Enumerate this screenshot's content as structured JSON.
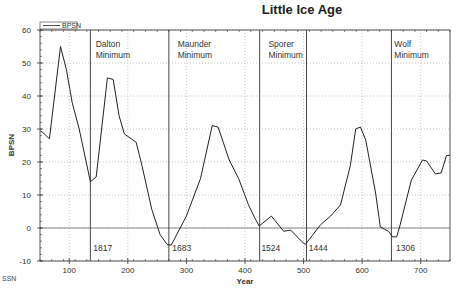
{
  "chart_data": {
    "type": "line",
    "title": "Little Ice Age",
    "xlabel": "Year",
    "ylabel": "BPSN",
    "xlim": [
      50,
      750
    ],
    "ylim": [
      -10,
      60
    ],
    "xticks": [
      100,
      200,
      300,
      400,
      500,
      600,
      700
    ],
    "yticks": [
      -10,
      0,
      10,
      20,
      30,
      40,
      50,
      60
    ],
    "grid": true,
    "legend": {
      "position": "top-left",
      "entries": [
        "BPSN"
      ]
    },
    "series": [
      {
        "name": "BPSN",
        "x": [
          50,
          56,
          66,
          85,
          95,
          105,
          117,
          136,
          146,
          165,
          175,
          185,
          194,
          214,
          224,
          241,
          255,
          267,
          274,
          300,
          324,
          344,
          354,
          373,
          389,
          406,
          416,
          424,
          445,
          466,
          478,
          494,
          503,
          529,
          546,
          563,
          580,
          589,
          597,
          606,
          623,
          631,
          645,
          652,
          659,
          665,
          684,
          703,
          710,
          725,
          735,
          744,
          750
        ],
        "y": [
          29.5,
          28.8,
          27,
          55,
          48,
          38,
          30,
          14,
          15.5,
          45.5,
          45,
          34,
          28.5,
          26,
          19,
          5.5,
          -2,
          -5,
          -5.2,
          3.6,
          15,
          31,
          30.6,
          20.6,
          15,
          7,
          3.3,
          0.6,
          3.6,
          -1,
          -0.6,
          -3.6,
          -5,
          1,
          3.6,
          7,
          19,
          30,
          30.6,
          26.7,
          10.6,
          0.3,
          -1,
          -2.7,
          -2.7,
          1,
          14.5,
          20.6,
          20.3,
          16.4,
          16.7,
          22,
          22
        ]
      }
    ],
    "reference_lines": {
      "horizontal": [
        0
      ],
      "vertical": [
        136,
        270,
        425,
        505,
        650
      ]
    },
    "annotations": [
      {
        "text": "Dalton",
        "line2": "Minimum",
        "x": 145,
        "y": 55
      },
      {
        "text": "Maunder",
        "line2": "Minimum",
        "x": 285,
        "y": 55
      },
      {
        "text": "Sporer",
        "line2": "Minimum",
        "x": 440,
        "y": 55
      },
      {
        "text": "Wolf",
        "line2": "Minimum",
        "x": 655,
        "y": 55
      },
      {
        "text": "1817",
        "x": 141,
        "y": -7
      },
      {
        "text": "1683",
        "x": 276,
        "y": -7
      },
      {
        "text": "1524",
        "x": 428,
        "y": -7
      },
      {
        "text": "1444",
        "x": 509,
        "y": -7
      },
      {
        "text": "1306",
        "x": 658,
        "y": -7
      }
    ]
  },
  "footer": {
    "label": "SSN"
  },
  "colors": {
    "line": "#222222",
    "grid": "#b0b0b0",
    "zero_line": "#888888",
    "vline": "#333333"
  }
}
